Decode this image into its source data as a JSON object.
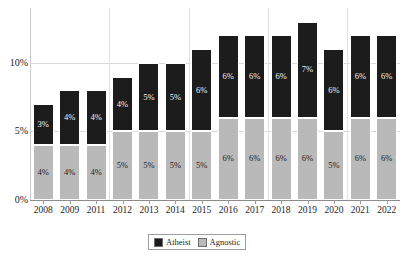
{
  "chart_data": {
    "type": "bar",
    "stacked": true,
    "title": "",
    "xlabel": "",
    "ylabel": "",
    "categories": [
      "2008",
      "2009",
      "2011",
      "2012",
      "2013",
      "2014",
      "2015",
      "2016",
      "2017",
      "2018",
      "2019",
      "2020",
      "2021",
      "2022"
    ],
    "series": [
      {
        "name": "Agnostic",
        "color": "#b9b9b9",
        "values": [
          4,
          4,
          4,
          5,
          5,
          5,
          5,
          6,
          6,
          6,
          6,
          5,
          6,
          6
        ],
        "labels": [
          "4%",
          "4%",
          "4%",
          "5%",
          "5%",
          "5%",
          "5%",
          "6%",
          "6%",
          "6%",
          "6%",
          "5%",
          "6%",
          "6%"
        ]
      },
      {
        "name": "Atheist",
        "color": "#1c1c1c",
        "values": [
          3,
          4,
          4,
          4,
          5,
          5,
          6,
          6,
          6,
          6,
          7,
          6,
          6,
          6
        ],
        "labels": [
          "3%",
          "4%",
          "4%",
          "4%",
          "5%",
          "5%",
          "6%",
          "6%",
          "6%",
          "6%",
          "7%",
          "6%",
          "6%",
          "6%"
        ]
      }
    ],
    "totals": [
      7,
      8,
      8,
      9,
      10,
      10,
      11,
      12,
      12,
      12,
      13,
      11,
      12,
      12
    ],
    "ylim": [
      0,
      14
    ],
    "y_ticks": [
      0,
      5,
      10
    ],
    "y_tick_labels": [
      "0%",
      "5%",
      "10%"
    ],
    "grid": true,
    "legend_position": "bottom-center",
    "legend_order": [
      "Atheist",
      "Agnostic"
    ]
  },
  "legend": {
    "atheist_label": "Atheist",
    "agnostic_label": "Agnostic"
  }
}
